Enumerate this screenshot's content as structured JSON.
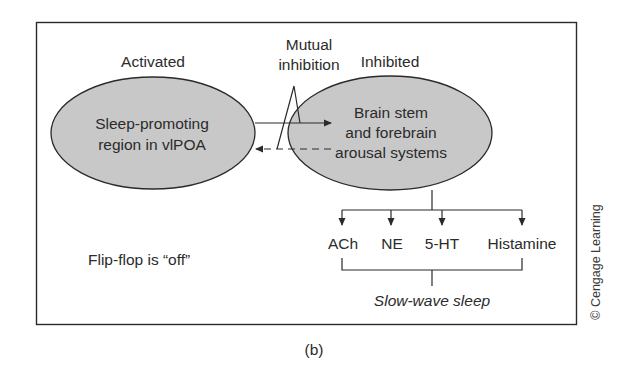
{
  "figure": {
    "panel_label": "(b)",
    "copyright": "© Cengage Learning",
    "state_caption": "Flip-flop is “off”",
    "colors": {
      "ellipse_fill": "#c8c8c8",
      "stroke": "#2a2a2a",
      "background": "#ffffff"
    }
  },
  "left_node": {
    "status_label": "Activated",
    "lines": [
      "Sleep-promoting",
      "region in vlPOA"
    ]
  },
  "right_node": {
    "status_label": "Inhibited",
    "lines": [
      "Brain stem",
      "and forebrain",
      "arousal systems"
    ]
  },
  "connection": {
    "label_lines": [
      "Mutual",
      "inhibition"
    ],
    "active_arrow": "solid (left → right)",
    "inactive_arrow": "dashed (right → left)"
  },
  "outputs": {
    "items": [
      "ACh",
      "NE",
      "5-HT",
      "Histamine"
    ],
    "result": "Slow-wave sleep"
  }
}
